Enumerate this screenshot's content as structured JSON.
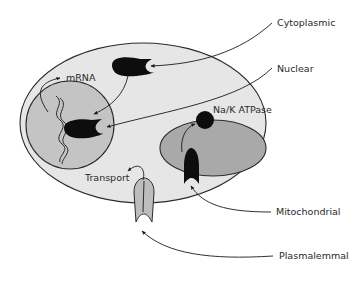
{
  "diagram": {
    "type": "cell receptor locations",
    "colors": {
      "background": "#ffffff",
      "cytoplasm": "#e6e6e6",
      "nucleus": "#c4c4c4",
      "mitochondrion": "#a9a9a9",
      "receptor": "#0d0d0d",
      "transporter": "#bdbdbd",
      "outline": "#2b2b2b"
    },
    "labels": {
      "cytoplasmic": "Cytoplasmic",
      "nuclear": "Nuclear",
      "na_k_atpase": "Na/K ATPase",
      "mitochondrial": "Mitochondrial",
      "plasmalemmal": "Plasmalemmal",
      "mrna": "mRNA",
      "transport": "Transport"
    }
  }
}
